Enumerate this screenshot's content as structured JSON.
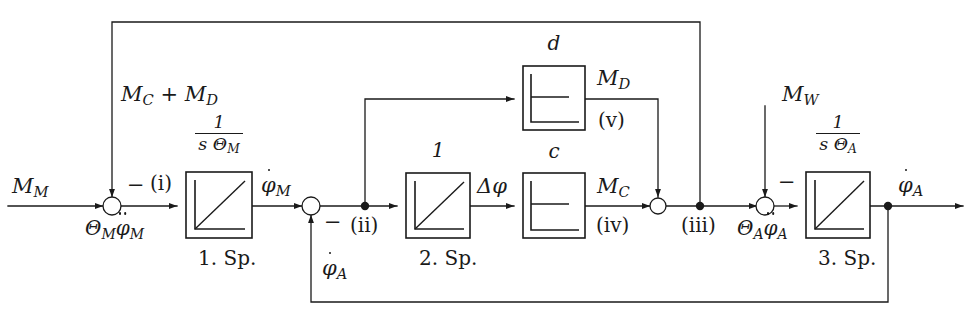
{
  "diagram": {
    "background": "#ffffff",
    "line_color": "#1a1a1a",
    "blocks": [
      {
        "id": "block-1",
        "gain_label_num": "1",
        "gain_label_den": "s Θ",
        "gain_label_den_sub": "M",
        "caption": "1. Sp.",
        "glyph": "ramp",
        "x": 186,
        "y": 172,
        "w": 66,
        "h": 66
      },
      {
        "id": "block-2",
        "gain_label_num": "1",
        "gain_label_den": "",
        "gain_label_den_sub": "",
        "caption": "2. Sp.",
        "glyph": "ramp",
        "x": 406,
        "y": 173,
        "w": 64,
        "h": 65
      },
      {
        "id": "block-c",
        "gain_label_num": "c",
        "gain_label_den": "",
        "gain_label_den_sub": "",
        "caption": "",
        "glyph": "step",
        "x": 523,
        "y": 173,
        "w": 62,
        "h": 65
      },
      {
        "id": "block-d",
        "gain_label_num": "d",
        "gain_label_den": "",
        "gain_label_den_sub": "",
        "caption": "",
        "glyph": "step",
        "x": 523,
        "y": 66,
        "w": 62,
        "h": 64
      },
      {
        "id": "block-3",
        "gain_label_num": "1",
        "gain_label_den": "s Θ",
        "gain_label_den_sub": "A",
        "caption": "3. Sp.",
        "glyph": "ramp",
        "x": 806,
        "y": 172,
        "w": 64,
        "h": 66
      }
    ],
    "block_labels": {
      "block_1_gain_num": "1",
      "block_1_gain_den_base": "s Θ",
      "block_1_gain_den_sub": "M",
      "block_2_gain": "1",
      "block_c_gain": "c",
      "block_d_gain": "d",
      "block_3_gain_num": "1",
      "block_3_gain_den_base": "s Θ",
      "block_3_gain_den_sub": "A",
      "caption_1": "1. Sp.",
      "caption_2": "2. Sp.",
      "caption_3": "3. Sp."
    },
    "signals": {
      "input_moment_base": "M",
      "input_moment_sub": "M",
      "feedback_top_base_1": "M",
      "feedback_top_sub_1": "C",
      "feedback_top_plus": " + ",
      "feedback_top_base_2": "M",
      "feedback_top_sub_2": "D",
      "accel_left_theta": "Θ",
      "accel_left_theta_sub": "M",
      "accel_left_phi": "φ",
      "accel_left_phi_sub": "M",
      "omega_motor_base": "φ",
      "omega_motor_sub": "M",
      "delta_phi_base": "Δφ",
      "moment_c_base": "M",
      "moment_c_sub": "C",
      "moment_d_base": "M",
      "moment_d_sub": "D",
      "moment_w_base": "M",
      "moment_w_sub": "W",
      "accel_right_theta": "Θ",
      "accel_right_theta_sub": "A",
      "accel_right_phi": "φ",
      "accel_right_phi_sub": "A",
      "omega_abtrieb_base": "φ",
      "omega_abtrieb_sub": "A",
      "feedback_bottom_base": "φ",
      "feedback_bottom_sub": "A"
    },
    "node_markers": {
      "i": "(i)",
      "ii": "(ii)",
      "iii": "(iii)",
      "iv": "(iv)",
      "v": "(v)"
    },
    "signs": {
      "minus_left": "−",
      "minus_mid": "−",
      "minus_right": "−"
    },
    "summing_junctions": [
      {
        "id": "sum-left",
        "cx": 112,
        "cy": 206,
        "r": 9,
        "sign": "−",
        "marker": "(i)"
      },
      {
        "id": "sum-mid",
        "cx": 311,
        "cy": 206,
        "r": 9,
        "sign": "−",
        "marker": ""
      },
      {
        "id": "sum-iv",
        "cx": 658,
        "cy": 206,
        "r": 8,
        "sign": "",
        "marker": "(iv)"
      },
      {
        "id": "sum-right",
        "cx": 765,
        "cy": 206,
        "r": 9,
        "sign": "−",
        "marker": ""
      }
    ],
    "branch_points": [
      {
        "id": "branch-ii",
        "cx": 365,
        "cy": 206,
        "marker": "(ii)"
      },
      {
        "id": "branch-iii",
        "cx": 700,
        "cy": 206,
        "marker": "(iii)"
      },
      {
        "id": "branch-out",
        "cx": 888,
        "cy": 206,
        "marker": ""
      }
    ]
  }
}
